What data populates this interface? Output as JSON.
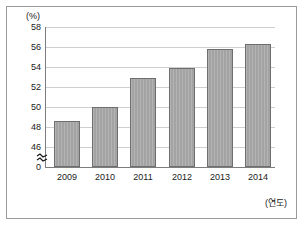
{
  "chart_data": {
    "type": "bar",
    "title": "",
    "subtitle": "",
    "xlabel": "(연도)",
    "ylabel": "(%)",
    "categories": [
      "2009",
      "2010",
      "2011",
      "2012",
      "2013",
      "2014"
    ],
    "values": [
      49.3,
      50.6,
      53.3,
      54.2,
      56.0,
      56.4
    ],
    "series": [
      {
        "name": "",
        "values": [
          49.3,
          50.6,
          53.3,
          54.2,
          56.0,
          56.4
        ]
      }
    ],
    "ylim": [
      45,
      58
    ],
    "yticks": [
      "58",
      "56",
      "54",
      "52",
      "50",
      "48",
      "46",
      "0"
    ],
    "ytick_values": [
      58,
      56,
      54,
      52,
      50,
      48,
      46,
      0
    ],
    "grid": true,
    "grid_axis": "y",
    "legend": false,
    "legend_position": "none",
    "axis_break": true,
    "axis_break_symbol": "≈",
    "annotations": [],
    "colors": {
      "bar_fill": "#a3a3a3",
      "bar_border": "#6e6e6e",
      "gridline": "#cfcfcf",
      "axis": "#7d7d7d",
      "frame": "#9a9a9a",
      "text": "#1a1a1a",
      "background": "#ffffff"
    }
  },
  "figure": {
    "unit_label": "(%)",
    "x_axis_caption": "(연도)"
  }
}
